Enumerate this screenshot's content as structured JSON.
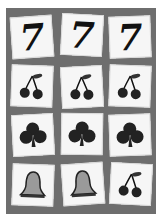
{
  "game": {
    "title": "Slot machine reels",
    "grid": {
      "rows": 4,
      "cols": 3,
      "symbols": [
        [
          "seven",
          "seven",
          "seven"
        ],
        [
          "cherries",
          "cherries",
          "cherries"
        ],
        [
          "club",
          "club",
          "club"
        ],
        [
          "bell",
          "bell",
          "cherries"
        ]
      ]
    },
    "seven_label": "7",
    "colors": {
      "panel": "#6e6e6e",
      "tile": "#f6f6f6",
      "symbol": "#111111",
      "bell": "#9a9a9a"
    }
  }
}
